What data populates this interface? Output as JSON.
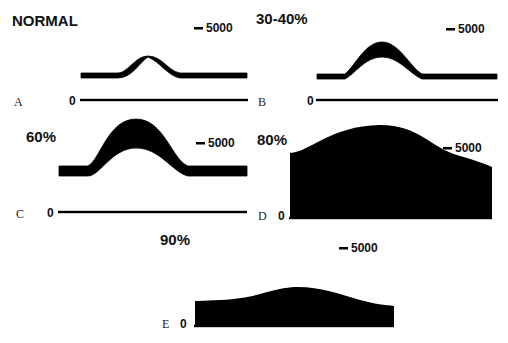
{
  "figure": {
    "background": "#ffffff",
    "ink": "#000000",
    "scale_bar_value": "5000",
    "zero_label": "0"
  },
  "panels": [
    {
      "letter": "A",
      "title": "NORMAL",
      "title_pos": [
        12,
        26
      ],
      "letter_pos": [
        14,
        106
      ],
      "scale_pos": [
        194,
        32
      ],
      "zero_pos": [
        69,
        105
      ],
      "baseline": {
        "x1": 80,
        "x2": 248,
        "y": 100
      },
      "top_path": "M81,73 L118,73 C128,73 135,56 148,56 C162,56 168,71 180,73 L247,73",
      "bottom_path": "M247,78 L180,78 C168,76 160,62 148,57 C140,62 132,78 118,78 L81,78 Z"
    },
    {
      "letter": "B",
      "title": "30-40%",
      "title_pos": [
        256,
        24
      ],
      "letter_pos": [
        258,
        106
      ],
      "scale_pos": [
        446,
        33
      ],
      "zero_pos": [
        307,
        105
      ],
      "baseline": {
        "x1": 316,
        "x2": 498,
        "y": 100
      },
      "top_path": "M317,74 L345,74 C355,66 365,42 382,42 C399,42 410,67 422,74 L497,74",
      "bottom_path": "M497,79 L422,79 C410,74 399,57 382,57 C365,57 355,74 345,79 L317,79 Z"
    },
    {
      "letter": "C",
      "title": "60%",
      "title_pos": [
        26,
        142
      ],
      "letter_pos": [
        16,
        218
      ],
      "scale_pos": [
        196,
        147
      ],
      "zero_pos": [
        47,
        217
      ],
      "baseline": {
        "x1": 58,
        "x2": 247,
        "y": 212
      },
      "top_path": "M59,166 L88,166 C100,160 108,119 136,119 C164,119 172,160 188,166 L247,166",
      "bottom_path": "M247,176 L188,176 C172,172 160,148 136,148 C112,148 100,176 88,176 L59,176 Z"
    },
    {
      "letter": "D",
      "title": "80%",
      "title_pos": [
        257,
        145
      ],
      "letter_pos": [
        258,
        220
      ],
      "scale_pos": [
        443,
        152
      ],
      "zero_pos": [
        278,
        220
      ],
      "baseline": {
        "x1": 289,
        "x2": 492,
        "y": 218
      },
      "area_path": "M290,153 C310,152 330,126 380,125 C420,125 430,148 460,156 C475,160 485,164 492,167 L492,218 L290,218 Z"
    },
    {
      "letter": "E",
      "title": "90%",
      "title_pos": [
        160,
        245
      ],
      "letter_pos": [
        162,
        328
      ],
      "scale_pos": [
        339,
        252
      ],
      "zero_pos": [
        180,
        328
      ],
      "baseline": {
        "x1": 194,
        "x2": 394,
        "y": 326
      },
      "area_path": "M195,301 C220,300 240,300 260,294 C280,288 290,287 298,287 C320,287 340,294 360,300 C375,304 385,305 394,306 L394,326 L195,326 Z"
    }
  ]
}
